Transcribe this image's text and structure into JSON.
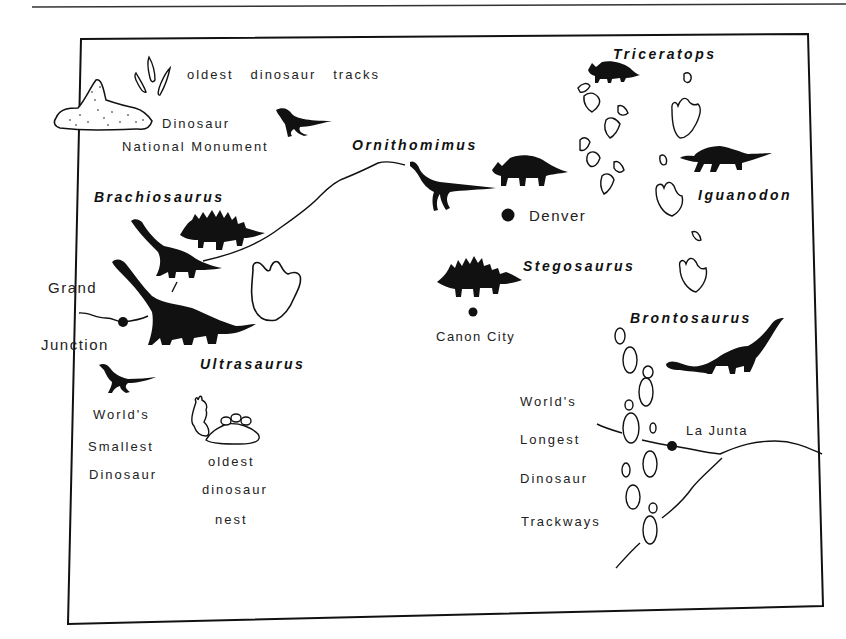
{
  "map": {
    "title": "Colorado dinosaur sites",
    "dinosaurs": [
      {
        "name": "Triceratops",
        "x": 613,
        "y": 47
      },
      {
        "name": "Ornithomimus",
        "x": 352,
        "y": 138
      },
      {
        "name": "Brachiosaurus",
        "x": 94,
        "y": 190
      },
      {
        "name": "Iguanodon",
        "x": 698,
        "y": 188
      },
      {
        "name": "Stegosaurus",
        "x": 523,
        "y": 259
      },
      {
        "name": "Brontosaurus",
        "x": 630,
        "y": 311
      },
      {
        "name": "Ultrasaurus",
        "x": 200,
        "y": 357
      }
    ],
    "cities": [
      {
        "name": "Denver",
        "x": 529,
        "y": 208
      },
      {
        "name": "Canon City",
        "x": 436,
        "y": 330
      },
      {
        "name": "Grand",
        "x": 48,
        "y": 280
      },
      {
        "name": "Junction",
        "x": 41,
        "y": 337
      },
      {
        "name": "La Junta",
        "x": 686,
        "y": 424
      }
    ],
    "annotations": {
      "oldest_tracks": "oldest   dinosaur   tracks",
      "monument_line1": "Dinosaur",
      "monument_line2": "National Monument",
      "smallest": [
        "World's",
        "Smallest",
        "Dinosaur"
      ],
      "nest": [
        "oldest",
        "dinosaur",
        "nest"
      ],
      "trackways": [
        "World's",
        "Longest",
        "Dinosaur",
        "Trackways"
      ]
    },
    "colors": {
      "ink": "#111111",
      "paper": "#ffffff"
    }
  }
}
